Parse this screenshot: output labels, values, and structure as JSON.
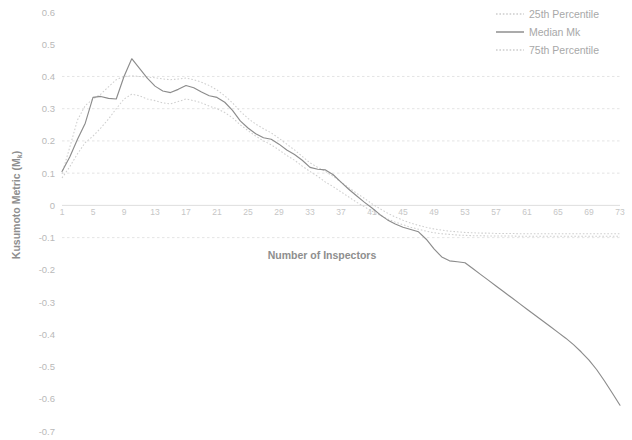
{
  "chart_data": {
    "type": "line",
    "title": "",
    "xlabel": "Number of Inspectors",
    "ylabel": "Kusumoto Metric (M",
    "ylabel_subscript": "k",
    "ylabel_suffix": ")",
    "xlim": [
      1,
      73
    ],
    "ylim": [
      -0.7,
      0.6
    ],
    "ytick_labels": [
      "0.6",
      "0.5",
      "0.4",
      "0.3",
      "0.2",
      "0.1",
      "0",
      "-0.1",
      "-0.2",
      "-0.3",
      "-0.4",
      "-0.5",
      "-0.6",
      "-0.7"
    ],
    "ytick_values": [
      0.6,
      0.5,
      0.4,
      0.3,
      0.2,
      0.1,
      0,
      -0.1,
      -0.2,
      -0.3,
      -0.4,
      -0.5,
      -0.6,
      -0.7
    ],
    "xtick_labels": [
      "1",
      "5",
      "9",
      "13",
      "17",
      "21",
      "25",
      "29",
      "33",
      "37",
      "41",
      "45",
      "49",
      "53",
      "57",
      "61",
      "65",
      "69",
      "73"
    ],
    "xtick_values": [
      1,
      5,
      9,
      13,
      17,
      21,
      25,
      29,
      33,
      37,
      41,
      45,
      49,
      53,
      57,
      61,
      65,
      69,
      73
    ],
    "grid": true,
    "grid_axis": "y",
    "legend_position": "top-right",
    "x": [
      1,
      2,
      3,
      4,
      5,
      6,
      7,
      8,
      9,
      10,
      11,
      12,
      13,
      14,
      15,
      16,
      17,
      18,
      19,
      20,
      21,
      22,
      23,
      24,
      25,
      26,
      27,
      28,
      29,
      30,
      31,
      32,
      33,
      34,
      35,
      36,
      37,
      38,
      39,
      40,
      41,
      42,
      43,
      44,
      45,
      46,
      47,
      48,
      49,
      50,
      51,
      52,
      53,
      54,
      55,
      56,
      57,
      58,
      59,
      60,
      61,
      62,
      63,
      64,
      65,
      66,
      67,
      68,
      69,
      70,
      71,
      72,
      73
    ],
    "series": [
      {
        "name": "25th Percentile",
        "style": "dotted",
        "color": "#cfcfcf",
        "values": [
          0.085,
          0.12,
          0.16,
          0.195,
          0.215,
          0.24,
          0.268,
          0.3,
          0.33,
          0.345,
          0.34,
          0.33,
          0.325,
          0.318,
          0.315,
          0.322,
          0.33,
          0.325,
          0.318,
          0.308,
          0.3,
          0.288,
          0.272,
          0.25,
          0.232,
          0.215,
          0.2,
          0.188,
          0.172,
          0.155,
          0.14,
          0.122,
          0.105,
          0.09,
          0.072,
          0.058,
          0.042,
          0.026,
          0.01,
          -0.004,
          -0.018,
          -0.03,
          -0.042,
          -0.052,
          -0.06,
          -0.068,
          -0.074,
          -0.08,
          -0.085,
          -0.088,
          -0.09,
          -0.092,
          -0.093,
          -0.094,
          -0.094,
          -0.095,
          -0.095,
          -0.095,
          -0.095,
          -0.096,
          -0.096,
          -0.096,
          -0.096,
          -0.096,
          -0.096,
          -0.096,
          -0.096,
          -0.096,
          -0.096,
          -0.096,
          -0.096,
          -0.096,
          -0.096
        ]
      },
      {
        "name": "Median Mk",
        "style": "solid",
        "color": "#8c8c8c",
        "values": [
          0.105,
          0.15,
          0.205,
          0.255,
          0.335,
          0.338,
          0.332,
          0.33,
          0.4,
          0.455,
          0.425,
          0.395,
          0.37,
          0.355,
          0.35,
          0.36,
          0.372,
          0.365,
          0.352,
          0.34,
          0.335,
          0.32,
          0.295,
          0.262,
          0.24,
          0.222,
          0.21,
          0.205,
          0.19,
          0.172,
          0.158,
          0.14,
          0.118,
          0.112,
          0.11,
          0.095,
          0.072,
          0.05,
          0.03,
          0.01,
          -0.008,
          -0.028,
          -0.045,
          -0.058,
          -0.068,
          -0.075,
          -0.082,
          -0.105,
          -0.135,
          -0.16,
          -0.172,
          -0.175,
          -0.178,
          -0.196,
          -0.214,
          -0.232,
          -0.25,
          -0.268,
          -0.286,
          -0.304,
          -0.322,
          -0.34,
          -0.358,
          -0.376,
          -0.394,
          -0.412,
          -0.432,
          -0.455,
          -0.48,
          -0.51,
          -0.545,
          -0.582,
          -0.62
        ]
      },
      {
        "name": "75th Percentile",
        "style": "dotted",
        "color": "#cfcfcf",
        "values": [
          0.098,
          0.18,
          0.265,
          0.31,
          0.33,
          0.345,
          0.368,
          0.39,
          0.4,
          0.402,
          0.4,
          0.398,
          0.396,
          0.392,
          0.39,
          0.392,
          0.395,
          0.39,
          0.382,
          0.372,
          0.358,
          0.34,
          0.318,
          0.292,
          0.27,
          0.252,
          0.238,
          0.225,
          0.208,
          0.19,
          0.172,
          0.152,
          0.132,
          0.118,
          0.105,
          0.09,
          0.072,
          0.055,
          0.038,
          0.022,
          0.005,
          -0.01,
          -0.024,
          -0.036,
          -0.046,
          -0.055,
          -0.062,
          -0.068,
          -0.073,
          -0.077,
          -0.08,
          -0.082,
          -0.084,
          -0.085,
          -0.086,
          -0.086,
          -0.087,
          -0.087,
          -0.087,
          -0.088,
          -0.088,
          -0.088,
          -0.088,
          -0.088,
          -0.088,
          -0.088,
          -0.088,
          -0.088,
          -0.088,
          -0.088,
          -0.088,
          -0.088,
          -0.088
        ]
      }
    ]
  },
  "legend": {
    "items": [
      {
        "label": "25th Percentile"
      },
      {
        "label": "Median Mk"
      },
      {
        "label": "75th Percentile"
      }
    ]
  }
}
